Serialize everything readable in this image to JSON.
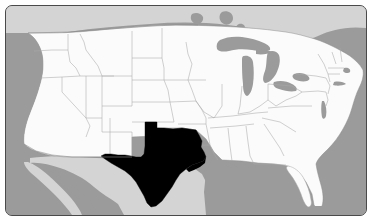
{
  "figure": {
    "type": "choropleth-locator-map",
    "width": 372,
    "height": 221
  },
  "frame": {
    "border_color": "#4a4a4a",
    "border_width": 1,
    "corner_radius": 7,
    "margin": 5
  },
  "colors": {
    "ocean": "#9b9b9b",
    "foreign_land": "#d4d4d4",
    "us_land": "#fbfbfb",
    "state_border": "#a8a8a8",
    "country_border": "#8f8f8f",
    "highlight": "#000000",
    "lake": "#9b9b9b",
    "page_background": "#ffffff"
  },
  "legend": {
    "visible": false,
    "entries": [
      {
        "label": "Highlighted state",
        "color": "#000000"
      },
      {
        "label": "Other states",
        "color": "#fbfbfb"
      },
      {
        "label": "Water",
        "color": "#9b9b9b"
      },
      {
        "label": "Neighboring countries",
        "color": "#d4d4d4"
      }
    ]
  },
  "highlighted": {
    "name": "Texas",
    "abbr": "TX",
    "fill": "#000000",
    "count": 1
  },
  "regions": {
    "water_bodies": [
      "Pacific Ocean",
      "Atlantic Ocean",
      "Gulf of Mexico",
      "Gulf of California",
      "Lake Superior",
      "Lake Michigan",
      "Lake Huron",
      "Lake Erie",
      "Lake Ontario"
    ],
    "neighbors": [
      "Canada",
      "Mexico"
    ]
  },
  "states": [
    "Washington",
    "Oregon",
    "California",
    "Nevada",
    "Idaho",
    "Montana",
    "Wyoming",
    "Utah",
    "Arizona",
    "Colorado",
    "New Mexico",
    "North Dakota",
    "South Dakota",
    "Nebraska",
    "Kansas",
    "Oklahoma",
    "Texas",
    "Minnesota",
    "Iowa",
    "Missouri",
    "Arkansas",
    "Louisiana",
    "Wisconsin",
    "Illinois",
    "Michigan",
    "Indiana",
    "Ohio",
    "Kentucky",
    "Tennessee",
    "Mississippi",
    "Alabama",
    "Georgia",
    "Florida",
    "South Carolina",
    "North Carolina",
    "Virginia",
    "West Virginia",
    "Maryland",
    "Delaware",
    "Pennsylvania",
    "New Jersey",
    "New York",
    "Connecticut",
    "Rhode Island",
    "Massachusetts",
    "Vermont",
    "New Hampshire",
    "Maine"
  ],
  "labels": {
    "visible": false,
    "text": []
  }
}
